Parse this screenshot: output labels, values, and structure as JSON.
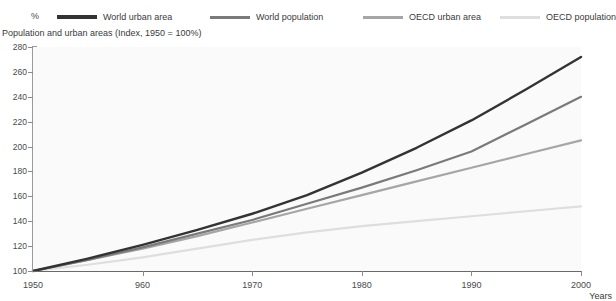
{
  "top_cut_text": "",
  "unit_label": "%",
  "subtitle": "Population and urban areas (Index, 1950 = 100%)",
  "years_axis_label": "Years",
  "colors": {
    "series_world_urban_area": "#333333",
    "series_world_population": "#7a7a7a",
    "series_oecd_urban_area": "#a6a6a6",
    "series_oecd_population": "#dedede",
    "axis": "#8a8a8a",
    "plot_background": "#fafafa",
    "text": "#3a3a3a"
  },
  "legend": {
    "items": [
      {
        "label": "World urban area",
        "color": "#333333"
      },
      {
        "label": "World population",
        "color": "#7a7a7a"
      },
      {
        "label": "OECD urban area",
        "color": "#a6a6a6"
      },
      {
        "label": "OECD population",
        "color": "#dedede"
      }
    ]
  },
  "axes": {
    "y_ticks": [
      "280",
      "260",
      "240",
      "220",
      "200",
      "180",
      "160",
      "140",
      "120",
      "100"
    ],
    "x_ticks": [
      "1950",
      "960",
      "1970",
      "1980",
      "1990",
      "2000"
    ]
  },
  "chart_data": {
    "type": "line",
    "title": "",
    "subtitle": "Population and urban areas (Index, 1950 = 100%)",
    "xlabel": "Years",
    "ylabel": "%",
    "xlim": [
      1950,
      2000
    ],
    "ylim": [
      100,
      280
    ],
    "grid": false,
    "legend_position": "top",
    "x": [
      1950,
      1955,
      1960,
      1965,
      1970,
      1975,
      1980,
      1985,
      1990,
      1995,
      2000
    ],
    "series": [
      {
        "name": "World urban area",
        "color": "#333333",
        "values": [
          100,
          110,
          121,
          133,
          146,
          161,
          179,
          199,
          221,
          246,
          272
        ]
      },
      {
        "name": "World population",
        "color": "#7a7a7a",
        "values": [
          100,
          109,
          119,
          130,
          141,
          154,
          167,
          181,
          196,
          218,
          240
        ]
      },
      {
        "name": "OECD urban area",
        "color": "#a6a6a6",
        "values": [
          100,
          109,
          118,
          128,
          139,
          150,
          161,
          172,
          183,
          194,
          205
        ]
      },
      {
        "name": "OECD population",
        "color": "#dedede",
        "values": [
          100,
          105,
          111,
          118,
          125,
          131,
          136,
          140,
          144,
          148,
          152
        ]
      }
    ]
  }
}
